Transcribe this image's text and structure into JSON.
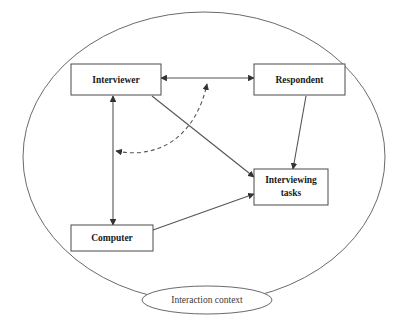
{
  "diagram": {
    "colors": {
      "box_stroke": "#4a4a4a",
      "ellipse_stroke": "#6a6a6a",
      "edge": "#555555",
      "text": "#1a1a1a",
      "background": "#ffffff"
    },
    "container": {
      "shape": "ellipse",
      "label": ""
    },
    "context_ellipse": {
      "shape": "ellipse",
      "label": "Interaction context"
    },
    "nodes": [
      {
        "id": "interviewer",
        "label": "Interviewer"
      },
      {
        "id": "respondent",
        "label": "Respondent"
      },
      {
        "id": "interviewing_tasks",
        "label_line1": "Interviewing",
        "label_line2": "tasks"
      },
      {
        "id": "computer",
        "label": "Computer"
      }
    ],
    "edges": [
      {
        "from": "interviewer",
        "to": "respondent",
        "style": "solid",
        "arrows": "both"
      },
      {
        "from": "interviewer",
        "to": "computer",
        "style": "solid",
        "arrows": "both"
      },
      {
        "from": "respondent",
        "to": "interviewing_tasks",
        "style": "solid",
        "arrows": "end"
      },
      {
        "from": "interviewer",
        "to": "interviewing_tasks",
        "style": "solid",
        "arrows": "end"
      },
      {
        "from": "computer",
        "to": "interviewing_tasks",
        "style": "solid",
        "arrows": "end"
      },
      {
        "from": "interviewer_computer_link",
        "to": "interviewer_respondent_link",
        "style": "dashed",
        "arrows": "both"
      }
    ]
  }
}
